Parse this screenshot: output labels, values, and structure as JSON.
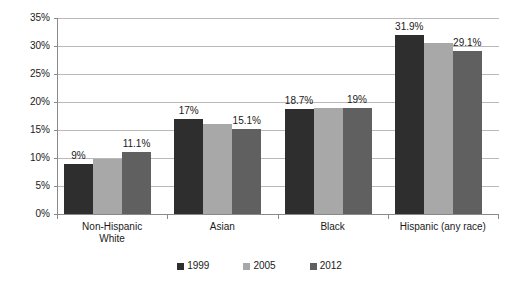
{
  "chart_data": {
    "type": "bar",
    "title": "",
    "subtitle": "",
    "xlabel": "",
    "ylabel": "",
    "ylim": [
      0,
      35
    ],
    "ytick_labels": [
      "0%",
      "5%",
      "10%",
      "15%",
      "20%",
      "25%",
      "30%",
      "35%"
    ],
    "ytick_values": [
      0,
      5,
      10,
      15,
      20,
      25,
      30,
      35
    ],
    "grid": true,
    "legend_position": "bottom",
    "categories": [
      "Non-Hispanic White",
      "Asian",
      "Black",
      "Hispanic (any race)"
    ],
    "category_lines": [
      [
        "Non-Hispanic",
        "White"
      ],
      [
        "Asian"
      ],
      [
        "Black"
      ],
      [
        "Hispanic (any race)"
      ]
    ],
    "series": [
      {
        "name": "1999",
        "color": "#2e2e2e",
        "values": [
          9,
          17,
          18.7,
          31.9
        ],
        "labels": [
          "9%",
          "17%",
          "18.7%",
          "31.9%"
        ]
      },
      {
        "name": "2005",
        "color": "#a8a8a8",
        "values": [
          9.8,
          16,
          19,
          30.5
        ],
        "labels": [
          "",
          "",
          "",
          ""
        ]
      },
      {
        "name": "2012",
        "color": "#606060",
        "values": [
          11.1,
          15.1,
          19,
          29.1
        ],
        "labels": [
          "11.1%",
          "15.1%",
          "19%",
          "29.1%"
        ]
      }
    ]
  },
  "colors": {
    "series_1999": "#2e2e2e",
    "series_2005": "#a8a8a8",
    "series_2012": "#606060",
    "gridline": "#b9b9b9",
    "axis": "#8a8a8a",
    "text": "#1a1a1a",
    "background": "#ffffff"
  }
}
